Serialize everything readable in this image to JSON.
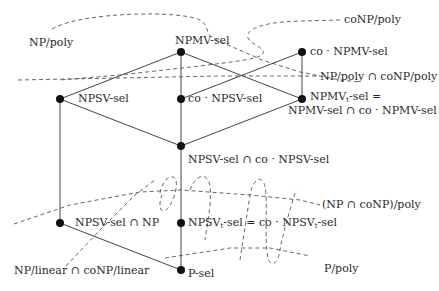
{
  "diagram": {
    "type": "class-inclusion-hasse-diagram",
    "nodes": [
      {
        "id": "npmv_sel",
        "label": "NPMV-sel",
        "x": 181,
        "y": 52
      },
      {
        "id": "co_npmv_sel",
        "label": "co · NPMV-sel",
        "x": 302,
        "y": 52
      },
      {
        "id": "npsv_sel",
        "label": "NPSV-sel",
        "x": 60,
        "y": 99
      },
      {
        "id": "co_npsv_sel",
        "label": "co · NPSV-sel",
        "x": 181,
        "y": 99
      },
      {
        "id": "npmvt_sel",
        "label_line1_pre": "NPMV",
        "label_line1_sub": "t",
        "label_line1_post": "-sel =",
        "label_line2": "NPMV-sel ∩ co · NPMV-sel",
        "x": 302,
        "y": 99
      },
      {
        "id": "npsv_cap_co",
        "label": "NPSV-sel ∩ co · NPSV-sel",
        "x": 181,
        "y": 146
      },
      {
        "id": "npsv_cap_np",
        "label": "NPSV-sel ∩ NP",
        "x": 60,
        "y": 223
      },
      {
        "id": "npsvt_sel",
        "label_pre": "NPSV",
        "label_sub": "t",
        "label_mid": "-sel = co · NPSV",
        "label_sub2": "t",
        "label_post": "-sel",
        "x": 181,
        "y": 223
      },
      {
        "id": "p_sel",
        "label": "P-sel",
        "x": 181,
        "y": 270
      }
    ],
    "edges": [
      [
        "npmv_sel",
        "npsv_sel"
      ],
      [
        "npmv_sel",
        "co_npsv_sel"
      ],
      [
        "npmv_sel",
        "npmvt_sel"
      ],
      [
        "co_npmv_sel",
        "co_npsv_sel"
      ],
      [
        "co_npmv_sel",
        "npmvt_sel"
      ],
      [
        "npsv_sel",
        "npsv_cap_co"
      ],
      [
        "co_npsv_sel",
        "npsv_cap_co"
      ],
      [
        "npmvt_sel",
        "npsv_cap_co"
      ],
      [
        "npsv_sel",
        "npsv_cap_np"
      ],
      [
        "npsv_cap_co",
        "npsvt_sel"
      ],
      [
        "npsv_cap_np",
        "p_sel"
      ],
      [
        "npsvt_sel",
        "p_sel"
      ]
    ],
    "region_labels": {
      "np_poly": "NP/poly",
      "conp_poly": "coNP/poly",
      "np_cap_conp_poly": "NP/poly ∩ coNP/poly",
      "np_conp_intersection_poly": "(NP ∩ coNP)/poly",
      "np_linear": "NP/linear ∩ coNP/linear",
      "p_poly": "P/poly"
    }
  }
}
